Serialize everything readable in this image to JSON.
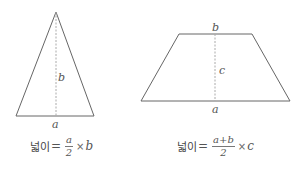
{
  "triangle": {
    "labels": {
      "base": "a",
      "height": "b"
    },
    "formula": {
      "label": "넓이",
      "equals": "=",
      "numerator": "a",
      "denominator": "2",
      "times": "×",
      "factor": "b"
    }
  },
  "trapezoid": {
    "labels": {
      "bottom": "a",
      "top": "b",
      "height": "c"
    },
    "formula": {
      "label": "넓이",
      "equals": "=",
      "numerator": "a+b",
      "denominator": "2",
      "times": "×",
      "factor": "c"
    }
  },
  "colors": {
    "stroke": "#666666",
    "dashed": "#999999",
    "text": "#555555"
  }
}
